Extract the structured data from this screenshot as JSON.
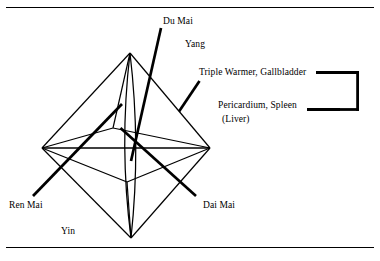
{
  "figure": {
    "type": "diagram",
    "background_color": "#ffffff",
    "ink_color": "#000000",
    "rules": [
      {
        "name": "top-rule",
        "y": 7
      },
      {
        "name": "bottom-rule",
        "y": 247
      }
    ]
  },
  "labels": {
    "du_mai": "Du Mai",
    "yang": "Yang",
    "triple_warmer": "Triple Warmer, Gallbladder",
    "pericardium": "Pericardium, Spleen",
    "liver": "(Liver)",
    "ren_mai": "Ren Mai",
    "dai_mai": "Dai Mai",
    "yin": "Yin"
  },
  "geometry": {
    "vertices": {
      "top_apex": [
        130,
        53
      ],
      "bottom_apex": [
        131,
        238
      ],
      "left": [
        42,
        148
      ],
      "right": [
        210,
        148
      ],
      "near": [
        127,
        182
      ],
      "far": [
        113,
        128
      ]
    },
    "inner_lens": {
      "left_curve_control": [
        118,
        145
      ],
      "right_curve_control": [
        140,
        145
      ]
    },
    "leader_lines": [
      {
        "name": "du-mai-leader",
        "from": [
          161,
          28
        ],
        "to": [
          131,
          160
        ],
        "weight": 2.6
      },
      {
        "name": "triple-warmer-leader",
        "from": [
          199,
          81
        ],
        "to": [
          179,
          111
        ],
        "weight": 2.6
      },
      {
        "name": "ren-mai-leader",
        "from": [
          33,
          196
        ],
        "to": [
          122,
          104
        ],
        "weight": 2.6
      },
      {
        "name": "dai-mai-leader",
        "from": [
          196,
          196
        ],
        "to": [
          120,
          128
        ],
        "weight": 2.6
      },
      {
        "name": "pericardium-leader",
        "from": [
          308,
          109
        ],
        "to": [
          338,
          109
        ],
        "weight": 3.0
      }
    ],
    "bracket": {
      "name": "pairing-bracket",
      "top": [
        318,
        72
      ],
      "right": 360,
      "bottom": [
        318,
        110
      ],
      "weight": 3.0
    }
  }
}
